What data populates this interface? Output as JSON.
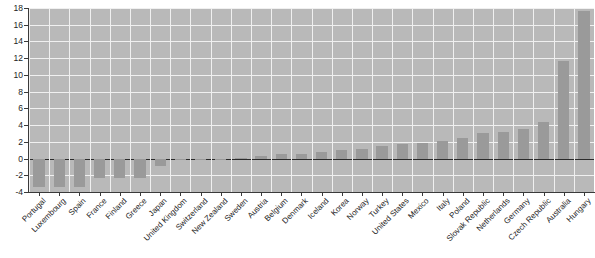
{
  "chart_data": {
    "type": "bar",
    "title": "",
    "subtitle": "",
    "xlabel": "",
    "ylabel": "",
    "ylim": [
      -4,
      18
    ],
    "ytick_labels": [
      "18",
      "16",
      "14",
      "12",
      "10",
      "8",
      "6",
      "4",
      "2",
      "0",
      "-2",
      "-4"
    ],
    "yticks": [
      18,
      16,
      14,
      12,
      10,
      8,
      6,
      4,
      2,
      0,
      -2,
      -4
    ],
    "grid": true,
    "legend": "none",
    "bar_color": "#9a9a9a",
    "plot_background": "#b9b9b9",
    "gridline_color": "#f0f0f0",
    "axis_color": "#3a3a3a",
    "categories": [
      "Portugal",
      "Luxembourg",
      "Spain",
      "France",
      "Finland",
      "Greece",
      "Japan",
      "United Kingdom",
      "Switzerland",
      "New Zealand",
      "Sweden",
      "Austria",
      "Belgium",
      "Denmark",
      "Iceland",
      "Korea",
      "Norway",
      "Turkey",
      "United States",
      "Mexico",
      "Italy",
      "Poland",
      "Slovak Republic",
      "Netherlands",
      "Germany",
      "Czech Republic",
      "Australia",
      "Hungary"
    ],
    "values": [
      -3.4,
      -3.4,
      -3.4,
      -2.3,
      -2.3,
      -2.3,
      -0.9,
      -0.2,
      -0.1,
      -0.1,
      0.1,
      0.3,
      0.5,
      0.6,
      0.8,
      1.0,
      1.2,
      1.5,
      1.7,
      1.9,
      2.1,
      2.5,
      3.0,
      3.2,
      3.5,
      4.4,
      11.7,
      17.6
    ]
  }
}
